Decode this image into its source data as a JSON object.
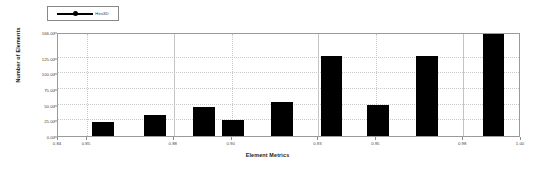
{
  "chart_data": {
    "type": "bar",
    "title": "",
    "xlabel": "Element Metrics",
    "ylabel": "Number of Elements",
    "legend": [
      {
        "name": "Hex3D",
        "marker": "line-with-dot-marker",
        "color": "#000000"
      }
    ],
    "legend_position": "top-left",
    "grid": true,
    "xlim": [
      0.84,
      1.0
    ],
    "ylim": [
      0.0,
      166.0
    ],
    "yticks": [
      0.0,
      25.0,
      50.0,
      75.0,
      100.0,
      125.0,
      166.0
    ],
    "ytick_labels": [
      "0.00",
      "25.00",
      "50.00",
      "75.00",
      "100.00",
      "125.00",
      "166.00"
    ],
    "xticks": [
      0.84,
      0.85,
      0.88,
      0.9,
      0.93,
      0.95,
      0.98,
      1.0
    ],
    "xtick_labels": [
      "0.84",
      "0.85",
      "0.88",
      "0.90",
      "0.93",
      "0.95",
      "0.98",
      "1.00"
    ],
    "bar_width": 0.0075,
    "x": [
      0.8555,
      0.8735,
      0.8905,
      0.9005,
      0.9175,
      0.9345,
      0.9505,
      0.9675,
      0.9905
    ],
    "values": [
      23,
      33,
      47,
      25,
      55,
      128,
      50,
      128,
      166
    ],
    "categories": [
      "0.8555",
      "0.8735",
      "0.8905",
      "0.9005",
      "0.9175",
      "0.9345",
      "0.9505",
      "0.9675",
      "0.9905"
    ],
    "series": [
      {
        "name": "Hex3D",
        "color": "#000000",
        "values": [
          23,
          33,
          47,
          25,
          55,
          128,
          50,
          128,
          166
        ]
      }
    ]
  },
  "colors": {
    "bar": "#000000",
    "axis": "#9a9a9a",
    "grid": "#c9c9c9",
    "text": "#444444",
    "background": "#ffffff"
  }
}
